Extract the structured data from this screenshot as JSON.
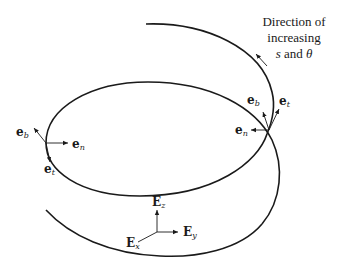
{
  "diagram": {
    "caption": {
      "line1": "Direction of",
      "line2": "increasing",
      "line3_var1": "s",
      "line3_and": " and ",
      "line3_var2": "θ"
    },
    "left_triad": {
      "eb": {
        "base": "e",
        "sub": "b"
      },
      "en": {
        "base": "e",
        "sub": "n"
      },
      "et": {
        "base": "e",
        "sub": "t"
      }
    },
    "right_triad": {
      "eb": {
        "base": "e",
        "sub": "b"
      },
      "en": {
        "base": "e",
        "sub": "n"
      },
      "et": {
        "base": "e",
        "sub": "t"
      }
    },
    "basis": {
      "Ez": {
        "base": "E",
        "sub": "z"
      },
      "Ey": {
        "base": "E",
        "sub": "y"
      },
      "Ex": {
        "base": "E",
        "sub": "x"
      }
    },
    "colors": {
      "stroke": "#1a1a1a",
      "background": "#ffffff"
    }
  }
}
